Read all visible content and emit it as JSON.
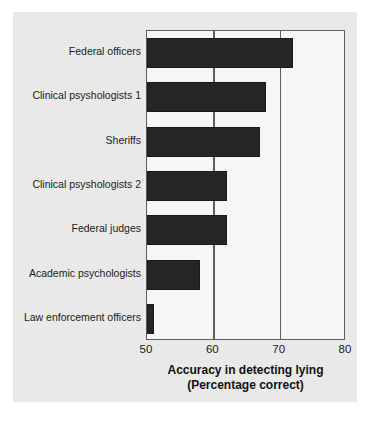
{
  "chart_data": {
    "type": "bar",
    "orientation": "horizontal",
    "title": "",
    "xlabel": "Accuracy in detecting lying",
    "xlabel_line2": "(Percentage correct)",
    "ylabel": "",
    "xlim": [
      50,
      80
    ],
    "xticks": [
      50,
      60,
      70,
      80
    ],
    "xtick_labels": [
      "50",
      "60",
      "70",
      "80"
    ],
    "gridlines": [
      60,
      70
    ],
    "grid": true,
    "legend": false,
    "bar_color": "#262626",
    "plot_background": "#f6f6f6",
    "panel_background": "#e9e9e9",
    "categories": [
      "Federal officers",
      "Clinical psyshologists 1",
      "Sheriffs",
      "Clinical psyshologists 2",
      "Federal judges",
      "Academic psychologists",
      "Law enforcement officers"
    ],
    "values": [
      72,
      68,
      67,
      62,
      62,
      58,
      51
    ]
  }
}
